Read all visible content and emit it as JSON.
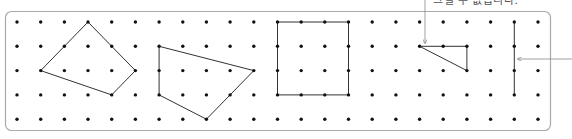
{
  "caption": {
    "text": "그릴 수 없습니다."
  },
  "colors": {
    "dot": "#111111",
    "line": "#333333",
    "frame": "#aaaaaa",
    "arrow": "#888888",
    "caption": "#555555"
  },
  "grid": {
    "columns": 23,
    "rows": 5,
    "origin_x": 17,
    "origin_y": 22,
    "spacing_x": 23.68,
    "spacing_y": 24.3
  },
  "frame": {
    "x": 5,
    "y": 11,
    "width": 545,
    "height": 119,
    "radius": 6
  },
  "shapes": [
    {
      "name": "quadrilateral-1",
      "closed": true,
      "points": [
        [
          3,
          0
        ],
        [
          5,
          2
        ],
        [
          4,
          3
        ],
        [
          1,
          2
        ]
      ]
    },
    {
      "name": "quadrilateral-2",
      "closed": true,
      "points": [
        [
          6,
          1
        ],
        [
          10,
          2
        ],
        [
          8,
          4
        ],
        [
          6,
          3
        ]
      ]
    },
    {
      "name": "square",
      "closed": true,
      "points": [
        [
          11,
          0
        ],
        [
          14,
          0
        ],
        [
          14,
          3
        ],
        [
          11,
          3
        ]
      ]
    },
    {
      "name": "open-triangle",
      "closed": false,
      "points": [
        [
          19,
          2
        ],
        [
          17,
          1
        ],
        [
          19,
          1
        ],
        [
          19,
          2
        ]
      ]
    },
    {
      "name": "vertical-segment",
      "closed": false,
      "points": [
        [
          21,
          0
        ],
        [
          21,
          3
        ]
      ]
    }
  ],
  "arrows": [
    {
      "name": "caption-arrow",
      "from": [
        425,
        0
      ],
      "to": [
        425,
        43
      ]
    },
    {
      "name": "side-arrow",
      "from": [
        572,
        59
      ],
      "to": [
        518,
        59
      ]
    }
  ]
}
